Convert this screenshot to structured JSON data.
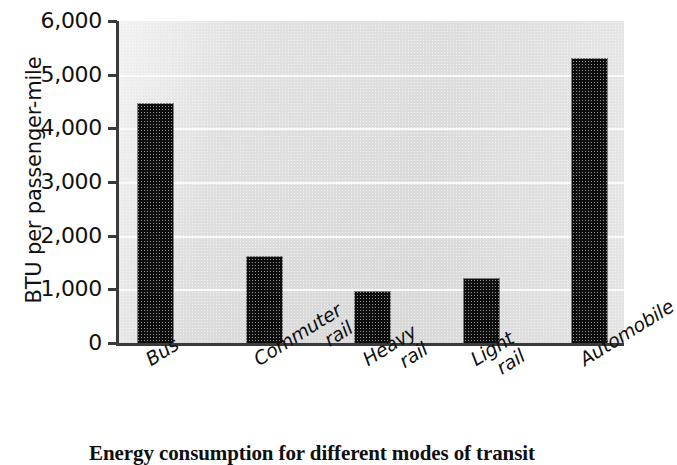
{
  "chart_data": {
    "type": "bar",
    "title": "",
    "caption": "Energy consumption for different modes of transit",
    "xlabel": "",
    "ylabel": "BTU per passenger-mile",
    "categories": [
      "Bus",
      "Commuter rail",
      "Heavy rail",
      "Light rail",
      "Automobile"
    ],
    "category_lines": [
      [
        "Bus"
      ],
      [
        "Commuter",
        "rail"
      ],
      [
        "Heavy",
        "rail"
      ],
      [
        "Light",
        "rail"
      ],
      [
        "Automobile"
      ]
    ],
    "values": [
      4450,
      1600,
      950,
      1200,
      5300
    ],
    "ylim": [
      0,
      6000
    ],
    "ytick_values": [
      0,
      1000,
      2000,
      3000,
      4000,
      5000,
      6000
    ],
    "ytick_labels": [
      "0",
      "1,000",
      "2,000",
      "3,000",
      "4,000",
      "5,000",
      "6,000"
    ],
    "grid": true,
    "grid_axis": "y",
    "legend": "none",
    "bar_color": "#0d0d0d",
    "plot_background": "#e0e0e0",
    "gridline_color": "#fbfbfb",
    "axis_color": "#3a3a3a"
  }
}
